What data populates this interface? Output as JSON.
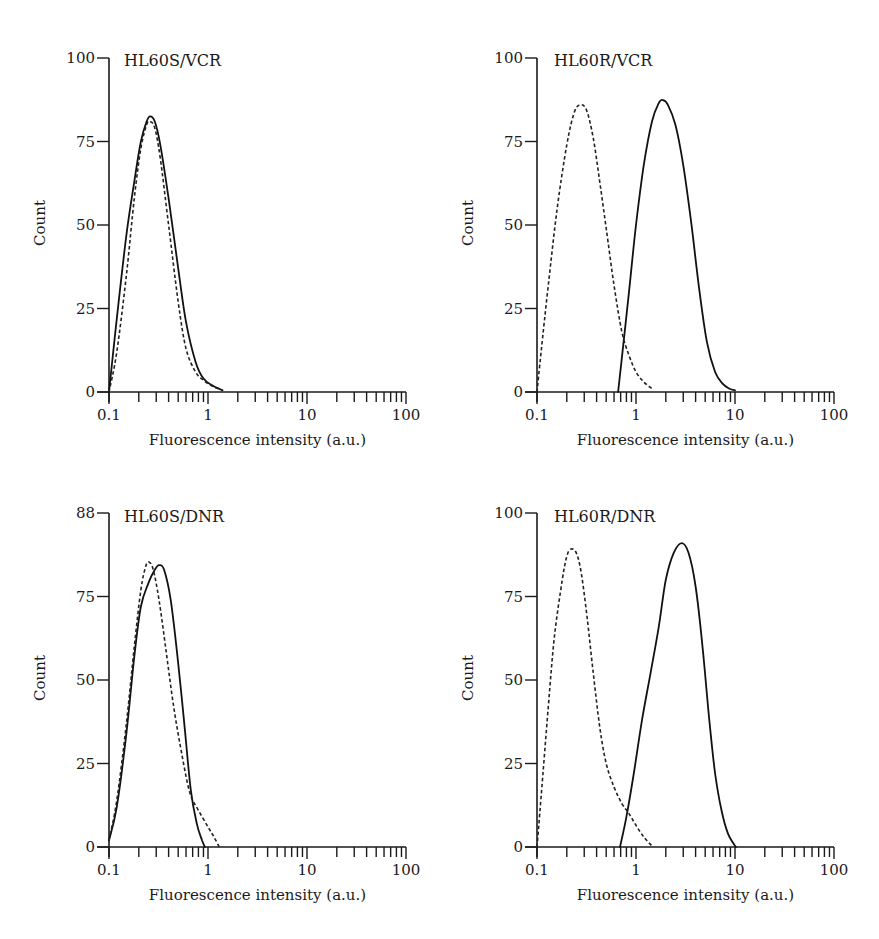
{
  "figure": {
    "x_axis_label": "Fluorescence intensity (a.u.)",
    "y_axis_label": "Count",
    "x_tick_labels": [
      "0.1",
      "1",
      "10",
      "100"
    ],
    "line_styles": {
      "solid": "#111111",
      "dashed": "#222222"
    }
  },
  "chart_data": [
    {
      "type": "line",
      "title": "HL60S/VCR",
      "xlabel": "Fluorescence intensity (a.u.)",
      "ylabel": "Count",
      "xscale": "log",
      "xlim": [
        0.1,
        100
      ],
      "ylim": [
        0,
        100
      ],
      "y_tick_labels": [
        "0",
        "25",
        "50",
        "75",
        "100"
      ],
      "x_tick_labels": [
        "0.1",
        "1",
        "10",
        "100"
      ],
      "grid": false,
      "series": [
        {
          "name": "solid",
          "style": "solid",
          "x": [
            0.1,
            0.12,
            0.15,
            0.18,
            0.21,
            0.24,
            0.26,
            0.29,
            0.33,
            0.4,
            0.5,
            0.6,
            0.75,
            0.9,
            1.1,
            1.4
          ],
          "y": [
            0,
            22,
            47,
            63,
            75,
            81,
            82.5,
            81,
            74,
            58,
            37,
            21,
            9,
            4,
            2,
            0.5
          ]
        },
        {
          "name": "dashed",
          "style": "dashed",
          "x": [
            0.1,
            0.12,
            0.15,
            0.18,
            0.21,
            0.24,
            0.26,
            0.29,
            0.33,
            0.4,
            0.5,
            0.6,
            0.75,
            0.9,
            1.1,
            1.4
          ],
          "y": [
            0,
            12,
            35,
            58,
            73,
            80,
            81,
            79,
            70,
            50,
            27,
            13,
            6,
            3.5,
            1.8,
            0.5
          ]
        }
      ]
    },
    {
      "type": "line",
      "title": "HL60R/VCR",
      "xlabel": "Fluorescence intensity (a.u.)",
      "ylabel": "Count",
      "xscale": "log",
      "xlim": [
        0.1,
        100
      ],
      "ylim": [
        0,
        100
      ],
      "y_tick_labels": [
        "0",
        "25",
        "50",
        "75",
        "100"
      ],
      "x_tick_labels": [
        "0.1",
        "1",
        "10",
        "100"
      ],
      "grid": false,
      "series": [
        {
          "name": "solid",
          "style": "solid",
          "x": [
            0.66,
            0.75,
            0.85,
            1.0,
            1.2,
            1.45,
            1.7,
            1.87,
            2.1,
            2.5,
            3.0,
            3.6,
            4.3,
            5.2,
            6.3,
            7.5,
            8.8,
            10.0
          ],
          "y": [
            0,
            15,
            30,
            50,
            68,
            81,
            86.5,
            87.4,
            86,
            80,
            68,
            51,
            32,
            15,
            6,
            2.5,
            1,
            0.5
          ]
        },
        {
          "name": "dashed",
          "style": "dashed",
          "x": [
            0.1,
            0.11,
            0.13,
            0.16,
            0.2,
            0.24,
            0.28,
            0.32,
            0.37,
            0.43,
            0.5,
            0.6,
            0.72,
            0.85,
            1.0,
            1.2,
            1.45
          ],
          "y": [
            0,
            12,
            32,
            55,
            74,
            84,
            86,
            84,
            76,
            63,
            49,
            32,
            18,
            11,
            6,
            3,
            1
          ]
        }
      ]
    },
    {
      "type": "line",
      "title": "HL60S/DNR",
      "xlabel": "Fluorescence intensity (a.u.)",
      "ylabel": "Count",
      "xscale": "log",
      "xlim": [
        0.1,
        100
      ],
      "ylim": [
        0,
        100
      ],
      "y_tick_labels": [
        "0",
        "25",
        "50",
        "75",
        "88"
      ],
      "x_tick_labels": [
        "0.1",
        "1",
        "10",
        "100"
      ],
      "grid": false,
      "series": [
        {
          "name": "solid",
          "style": "solid",
          "x": [
            0.1,
            0.12,
            0.15,
            0.18,
            0.21,
            0.25,
            0.29,
            0.32,
            0.36,
            0.42,
            0.5,
            0.58,
            0.67,
            0.77,
            0.87,
            0.93
          ],
          "y": [
            2,
            12,
            34,
            57,
            72,
            79,
            83,
            84.4,
            83,
            74,
            55,
            36,
            17,
            7,
            2,
            0
          ]
        },
        {
          "name": "dashed",
          "style": "dashed",
          "x": [
            0.1,
            0.12,
            0.15,
            0.18,
            0.21,
            0.235,
            0.254,
            0.28,
            0.32,
            0.38,
            0.45,
            0.55,
            0.66,
            0.8,
            1.0,
            1.15,
            1.3
          ],
          "y": [
            2,
            14,
            37,
            60,
            77,
            84,
            85.3,
            83,
            74,
            58,
            42,
            27,
            16,
            11,
            6,
            3,
            0
          ]
        }
      ]
    },
    {
      "type": "line",
      "title": "HL60R/DNR",
      "xlabel": "Fluorescence intensity (a.u.)",
      "ylabel": "Count",
      "xscale": "log",
      "xlim": [
        0.1,
        100
      ],
      "ylim": [
        0,
        100
      ],
      "y_tick_labels": [
        "0",
        "25",
        "50",
        "75",
        "100"
      ],
      "x_tick_labels": [
        "0.1",
        "1",
        "10",
        "100"
      ],
      "grid": false,
      "series": [
        {
          "name": "solid",
          "style": "solid",
          "x": [
            0.69,
            0.8,
            0.95,
            1.15,
            1.4,
            1.7,
            2.0,
            2.4,
            2.9,
            3.4,
            4.0,
            4.7,
            5.5,
            6.3,
            7.3,
            8.5,
            10.2
          ],
          "y": [
            0,
            9,
            22,
            38,
            52,
            66,
            80,
            88,
            91,
            88,
            78,
            60,
            38,
            22,
            11,
            4,
            0
          ]
        },
        {
          "name": "dashed",
          "style": "dashed",
          "x": [
            0.1,
            0.11,
            0.13,
            0.15,
            0.18,
            0.2,
            0.22,
            0.25,
            0.28,
            0.32,
            0.37,
            0.43,
            0.5,
            0.6,
            0.72,
            0.85,
            1.0,
            1.2,
            1.48
          ],
          "y": [
            0,
            15,
            42,
            63,
            80,
            87,
            89.2,
            88,
            82,
            69,
            52,
            36,
            25,
            18,
            13,
            10,
            6.5,
            3,
            0
          ]
        }
      ]
    }
  ]
}
